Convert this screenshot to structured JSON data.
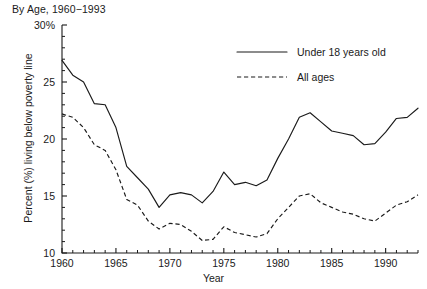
{
  "chart_data": {
    "type": "line",
    "title": "By Age, 1960−1993",
    "xlabel": "Year",
    "ylabel": "Percent (%) living below poverty line",
    "xlim": [
      1960,
      1993
    ],
    "ylim": [
      10,
      30
    ],
    "ytick_labels": [
      "10",
      "15",
      "20",
      "25",
      "30%"
    ],
    "ytick_values": [
      10,
      15,
      20,
      25,
      30
    ],
    "ytick_minor_step": 1,
    "xtick_labels": [
      "1960",
      "1965",
      "1970",
      "1975",
      "1980",
      "1985",
      "1990"
    ],
    "xtick_values": [
      1960,
      1965,
      1970,
      1975,
      1980,
      1985,
      1990
    ],
    "xtick_minor_step": 1,
    "grid": false,
    "legend_position": "upper-right-inside",
    "x": [
      1960,
      1961,
      1962,
      1963,
      1964,
      1965,
      1966,
      1967,
      1968,
      1969,
      1970,
      1971,
      1972,
      1973,
      1974,
      1975,
      1976,
      1977,
      1978,
      1979,
      1980,
      1981,
      1982,
      1983,
      1984,
      1985,
      1986,
      1987,
      1988,
      1989,
      1990,
      1991,
      1992,
      1993
    ],
    "series": [
      {
        "name": "Under 18 years old",
        "style": "solid",
        "values": [
          26.9,
          25.6,
          25.0,
          23.1,
          23.0,
          21.0,
          17.6,
          16.6,
          15.6,
          14.0,
          15.1,
          15.3,
          15.1,
          14.4,
          15.4,
          17.1,
          16.0,
          16.2,
          15.9,
          16.4,
          18.3,
          20.0,
          21.9,
          22.3,
          21.5,
          20.7,
          20.5,
          20.3,
          19.5,
          19.6,
          20.6,
          21.8,
          21.9,
          22.7
        ]
      },
      {
        "name": "All ages",
        "style": "dashed",
        "values": [
          22.2,
          21.9,
          21.0,
          19.5,
          19.0,
          17.3,
          14.7,
          14.2,
          12.8,
          12.1,
          12.6,
          12.5,
          11.9,
          11.1,
          11.2,
          12.3,
          11.8,
          11.6,
          11.4,
          11.7,
          13.0,
          14.0,
          15.0,
          15.2,
          14.4,
          14.0,
          13.6,
          13.4,
          13.0,
          12.8,
          13.5,
          14.2,
          14.5,
          15.1
        ]
      }
    ],
    "legend": [
      {
        "label": "Under 18 years old",
        "style": "solid"
      },
      {
        "label": "All ages",
        "style": "dashed"
      }
    ]
  },
  "colors": {
    "ink": "#1a1a1a",
    "background": "#ffffff"
  }
}
